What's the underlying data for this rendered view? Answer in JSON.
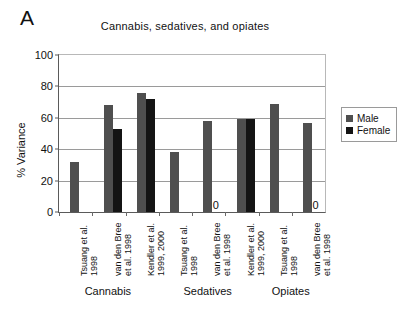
{
  "panel": {
    "letter": "A"
  },
  "legend": {
    "position": "right",
    "entries": [
      {
        "label": "Male",
        "color": "#4f4f4f"
      },
      {
        "label": "Female",
        "color": "#141414"
      }
    ]
  },
  "chart_data": {
    "type": "bar",
    "title": "Cannabis, sedatives, and opiates",
    "xlabel": "",
    "ylabel": "% Variance",
    "ylim": [
      0,
      100
    ],
    "yticks": [
      0,
      20,
      40,
      60,
      80,
      100
    ],
    "grid": true,
    "categories": [
      "Tsuang et al. 1998",
      "van den Bree et al. 1998",
      "Kendler et al. 1999, 2000",
      "Tsuang et al. 1998",
      "van den Bree et al. 1998",
      "Kendler et al. 1999, 2000",
      "Tsuang et al. 1998",
      "van den Bree et al. 1998"
    ],
    "category_lines": [
      [
        "Tsuang et al.",
        "1998"
      ],
      [
        "van den Bree",
        "et al. 1998"
      ],
      [
        "Kendler et al.",
        "1999, 2000"
      ],
      [
        "Tsuang et al.",
        "1998"
      ],
      [
        "van den Bree",
        "et al. 1998"
      ],
      [
        "Kendler et al.",
        "1999, 2000"
      ],
      [
        "Tsuang et al.",
        "1998"
      ],
      [
        "van den Bree",
        "et al. 1998"
      ]
    ],
    "groups": [
      {
        "label": "Cannabis",
        "indices": [
          0,
          1,
          2
        ]
      },
      {
        "label": "Sedatives",
        "indices": [
          3,
          4,
          5
        ]
      },
      {
        "label": "Opiates",
        "indices": [
          6,
          7
        ]
      }
    ],
    "series": [
      {
        "name": "Male",
        "color": "#4f4f4f",
        "values": [
          32,
          68,
          76,
          38,
          58,
          59,
          69,
          57
        ]
      },
      {
        "name": "Female",
        "color": "#141414",
        "values": [
          null,
          53,
          72,
          null,
          0,
          59,
          null,
          0
        ]
      }
    ],
    "zero_annotations": [
      {
        "category_index": 4,
        "series": "Female",
        "text": "0"
      },
      {
        "category_index": 7,
        "series": "Female",
        "text": "0"
      }
    ]
  }
}
